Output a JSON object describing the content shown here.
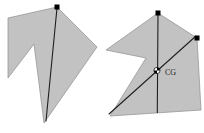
{
  "figure": {
    "background": "#ffffff",
    "shape_fill": "#c2c2c2",
    "shape_stroke": "#8e8e8e",
    "line_color": "#1f1f1f",
    "dot_color": "#000000",
    "dot_size": 5,
    "cg_label": "CG",
    "panels": [
      {
        "name": "shape-first-suspension",
        "polygon": [
          [
            57,
            7
          ],
          [
            97,
            47
          ],
          [
            44,
            123
          ],
          [
            34,
            44
          ],
          [
            8,
            78
          ],
          [
            8,
            18
          ]
        ],
        "plumb_lines": [
          [
            [
              57,
              8
            ],
            [
              46,
              121
            ]
          ]
        ],
        "suspension_dots": [
          [
            57,
            7
          ]
        ]
      },
      {
        "name": "shape-second-suspension",
        "polygon": [
          [
            158,
            13
          ],
          [
            197,
            38
          ],
          [
            201,
            110
          ],
          [
            110,
            116
          ],
          [
            146,
            58
          ],
          [
            106,
            50
          ]
        ],
        "plumb_lines": [
          [
            [
              158,
              13
            ],
            [
              157.3,
              112.6
            ]
          ],
          [
            [
              196,
              36
            ],
            [
              109,
              114
            ]
          ]
        ],
        "suspension_dots": [
          [
            158,
            13
          ],
          [
            197,
            38
          ]
        ],
        "cg_marker": {
          "x": 157,
          "y": 70.5,
          "r": 3.1
        },
        "cg_label_pos": {
          "x": 165,
          "y": 75
        }
      }
    ]
  }
}
